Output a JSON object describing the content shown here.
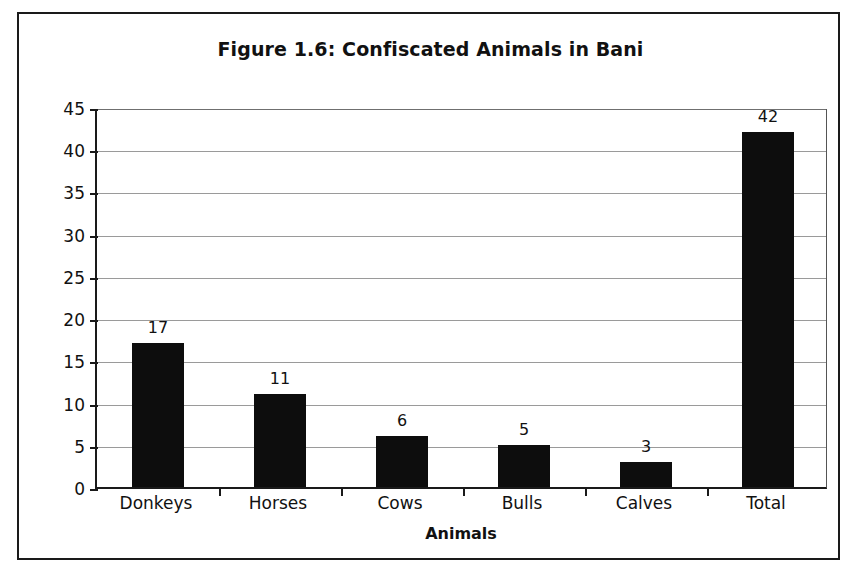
{
  "chart_data": {
    "type": "bar",
    "title": "Figure 1.6: Confiscated Animals in Bani",
    "xlabel": "Animals",
    "ylabel": "",
    "categories": [
      "Donkeys",
      "Horses",
      "Cows",
      "Bulls",
      "Calves",
      "Total"
    ],
    "values": [
      17,
      11,
      6,
      5,
      3,
      42
    ],
    "value_labels": [
      "17",
      "11",
      "6",
      "5",
      "3",
      "42"
    ],
    "ylim": [
      0,
      45
    ],
    "ytick_values": [
      0,
      5,
      10,
      15,
      20,
      25,
      30,
      35,
      40,
      45
    ],
    "ytick_labels": [
      "0",
      "5",
      "10",
      "15",
      "20",
      "25",
      "30",
      "35",
      "40",
      "45"
    ],
    "grid": true,
    "legend": false,
    "bar_color": "#0d0d0d",
    "grid_color": "#9a9a9a",
    "axis_color": "#1a1a1a"
  }
}
